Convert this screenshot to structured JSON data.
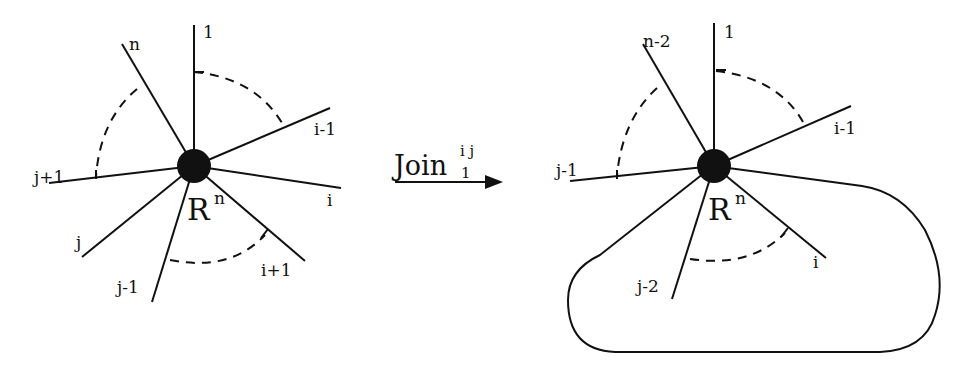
{
  "left_diagram": {
    "vertex_label": "R",
    "vertex_superscript": "n",
    "edges": {
      "e1": "1",
      "en": "n",
      "ei_minus_1": "i-1",
      "ei": "i",
      "ei_plus_1": "i+1",
      "ej_minus_1": "j-1",
      "ej": "j",
      "ej_plus_1": "j+1"
    }
  },
  "operation": {
    "label": "Join",
    "superscript": "i j",
    "subscript": "1"
  },
  "right_diagram": {
    "vertex_label": "R",
    "vertex_superscript": "n",
    "edges": {
      "e1": "1",
      "en_minus_2": "n-2",
      "ei_minus_1": "i-1",
      "ei": "i",
      "ej_minus_2": "j-2",
      "ej_minus_1": "j-1"
    }
  },
  "colors": {
    "ink": "#111111",
    "background": "#ffffff"
  }
}
